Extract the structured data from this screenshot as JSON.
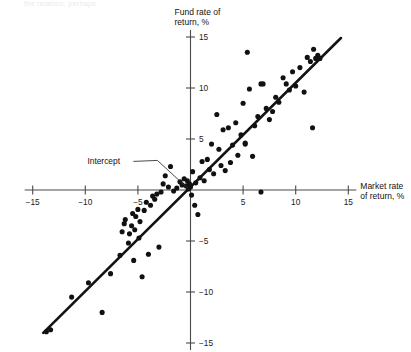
{
  "figure": {
    "cropped_top_text": "the relation, perhaps",
    "annotation": {
      "label": "Intercept"
    }
  },
  "chart_data": {
    "type": "scatter",
    "title": "",
    "subtitle": "",
    "xlabel_line1": "Market rate",
    "xlabel_line2": "of return, %",
    "ylabel_line1": "Fund rate of",
    "ylabel_line2": "return, %",
    "xlabel": "Market rate of return, %",
    "ylabel": "Fund rate of return, %",
    "xlim": [
      -15,
      15
    ],
    "ylim": [
      -15,
      15
    ],
    "xticks": [
      -15,
      -10,
      -5,
      5,
      10,
      15
    ],
    "xtick_labels": [
      "−15",
      "−10",
      "−5",
      "5",
      "10",
      "15"
    ],
    "yticks": [
      -15,
      -10,
      -5,
      5,
      10,
      15
    ],
    "ytick_labels": [
      "−15",
      "−10",
      "−5",
      "5",
      "10",
      "15"
    ],
    "grid": false,
    "legend": "none",
    "axes_style": "crossed-at-origin",
    "marker_color": "#111111",
    "line_color": "#131313",
    "axis_color": "#4a4a4a",
    "background": "#ffffff",
    "annotations": [
      {
        "text": "Intercept",
        "points_to_x": 0,
        "points_to_y": 0,
        "label_x": -9.8,
        "label_y": 2.9
      }
    ],
    "fit_line": {
      "kind": "regression",
      "x_start": -14.0,
      "y_start": -14.0,
      "x_end": 14.3,
      "y_end": 14.9,
      "slope": 1.02,
      "intercept": 0.2
    },
    "x": [
      -13.7,
      -13.3,
      -11.3,
      -9.7,
      -8.4,
      -7.6,
      -6.7,
      -6.5,
      -6.3,
      -6.2,
      -5.9,
      -5.8,
      -5.6,
      -5.5,
      -5.4,
      -5.3,
      -5.2,
      -5.0,
      -4.9,
      -4.8,
      -4.6,
      -4.4,
      -4.2,
      -4.0,
      -3.8,
      -3.6,
      -3.4,
      -3.2,
      -3.0,
      -2.8,
      -2.6,
      -2.4,
      -2.1,
      -1.9,
      -1.6,
      -1.3,
      -1.0,
      -0.8,
      -0.6,
      -0.4,
      -0.3,
      -0.2,
      -0.1,
      0.0,
      0.1,
      0.2,
      0.4,
      0.5,
      0.7,
      0.9,
      1.1,
      1.3,
      1.6,
      1.8,
      2.0,
      2.2,
      2.5,
      2.7,
      2.9,
      3.1,
      3.3,
      3.6,
      3.8,
      4.0,
      4.3,
      4.5,
      4.8,
      5.0,
      5.2,
      5.4,
      5.6,
      5.9,
      6.1,
      6.4,
      6.7,
      6.9,
      7.2,
      7.5,
      7.8,
      8.1,
      8.4,
      8.8,
      9.1,
      9.4,
      9.7,
      10.0,
      10.4,
      10.8,
      11.1,
      11.4,
      11.7,
      11.9,
      12.1,
      12.3,
      6.7,
      11.6,
      5.2
    ],
    "y": [
      -13.9,
      -13.7,
      -10.5,
      -9.1,
      -12.0,
      -8.2,
      -6.4,
      -4.1,
      -3.3,
      -2.9,
      -5.2,
      -4.3,
      -3.5,
      -2.3,
      -6.9,
      -3.9,
      -2.6,
      -1.9,
      -4.7,
      -3.1,
      -8.5,
      -2.0,
      -1.2,
      -6.3,
      -1.5,
      -0.6,
      -0.9,
      -0.4,
      -5.6,
      -0.2,
      0.6,
      1.4,
      0.3,
      2.3,
      -0.1,
      0.2,
      0.8,
      0.5,
      1.1,
      0.4,
      0.9,
      0.1,
      0.6,
      0.3,
      -0.5,
      1.8,
      -1.5,
      0.7,
      -2.4,
      1.2,
      2.8,
      0.9,
      3.0,
      2.0,
      4.5,
      1.6,
      7.4,
      4.0,
      2.4,
      5.9,
      1.9,
      6.1,
      2.7,
      4.4,
      6.6,
      3.4,
      5.4,
      8.5,
      4.6,
      13.5,
      9.9,
      3.3,
      6.3,
      7.2,
      10.4,
      10.4,
      8.0,
      6.9,
      7.7,
      9.1,
      8.6,
      11.0,
      10.4,
      9.8,
      11.6,
      10.2,
      12.0,
      9.6,
      13.0,
      12.6,
      13.8,
      12.9,
      13.2,
      12.9,
      -0.2,
      6.1,
      4.5
    ]
  }
}
